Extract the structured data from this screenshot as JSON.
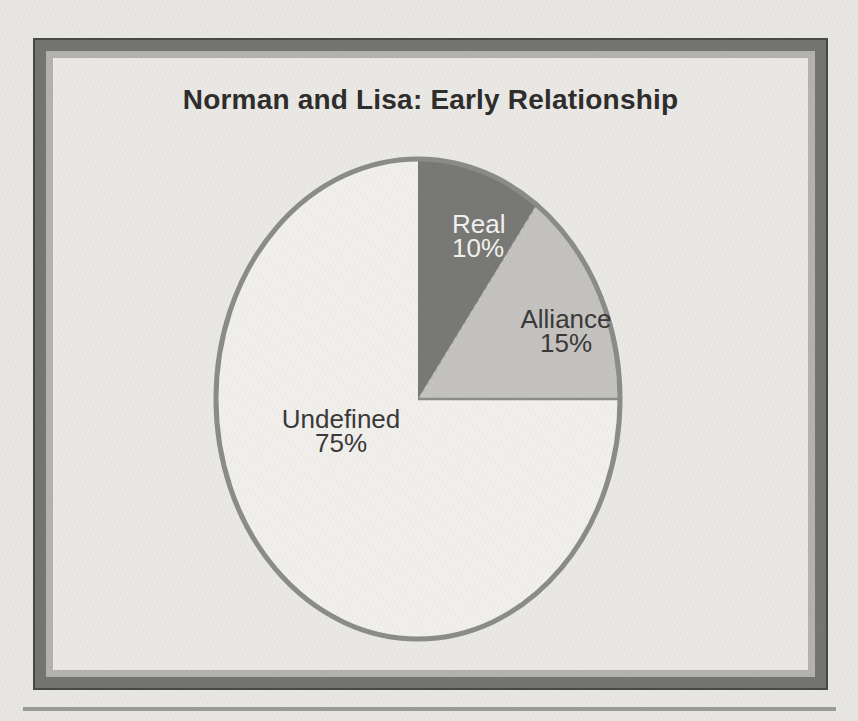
{
  "figure": {
    "colors": {
      "page_bg": "#e7e6e2",
      "canvas_bg": "#e9e8e4",
      "frame_line": "#474745",
      "frame_dark": "#747472",
      "frame_light": "#b3b2af",
      "rule_color": "#9a9a98",
      "title_color": "#2e2d2b"
    }
  },
  "chart_data": {
    "type": "pie",
    "title": "Norman and Lisa: Early Relationship",
    "start_angle_deg": 90,
    "direction": "clockwise",
    "legend": "none",
    "labels_position": "inside",
    "outline_color": "#8b8b89",
    "divider_color": "#8b8b89",
    "slices": [
      {
        "label": "Real",
        "value": 10,
        "pct": "10%",
        "color": "#787876",
        "text_color": "#f2f1ed"
      },
      {
        "label": "Alliance",
        "value": 15,
        "pct": "15%",
        "color": "#c3c2bf",
        "text_color": "#3a3938"
      },
      {
        "label": "Undefined",
        "value": 75,
        "pct": "75%",
        "color": "#f0efeb",
        "text_color": "#3a3938"
      }
    ]
  }
}
